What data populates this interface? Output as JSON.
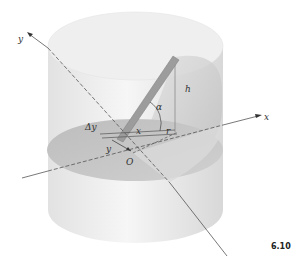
{
  "figure": {
    "number": "6.10",
    "labels": {
      "y_axis": "y",
      "x_axis": "x",
      "height": "h",
      "angle": "α",
      "delta_y": "Δy",
      "y_offset": "y",
      "x_len": "x",
      "radius": "r",
      "origin": "O"
    }
  },
  "colors": {
    "cylinder_body": "#e9e9e9",
    "cylinder_top": "#f2f2f2",
    "section": "#c4c4c4",
    "rod": "#9a9a9a",
    "axis": "#555555"
  }
}
